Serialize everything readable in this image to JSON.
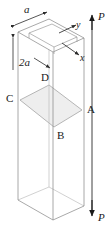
{
  "figure": {
    "type": "engineering-mechanics-diagram",
    "colors": {
      "outline": "#8c8c8c",
      "hidden_outline": "#b5b5b5",
      "section_fill": "#eeeeee",
      "section_edge": "#9a9a9a",
      "arrow": "#1a1a1a",
      "text": "#1a1a1a",
      "background": "#ffffff"
    }
  },
  "dimensions": {
    "width_label": "a",
    "depth_label": "2a"
  },
  "axes": {
    "x_label": "x",
    "y_label": "y"
  },
  "loads": {
    "top_label": "P",
    "bottom_label": "P"
  },
  "section": {
    "name": "ABCD",
    "vertices": [
      {
        "id": "A",
        "label": "A",
        "position": "right"
      },
      {
        "id": "B",
        "label": "B",
        "position": "bottom"
      },
      {
        "id": "C",
        "label": "C",
        "position": "left"
      },
      {
        "id": "D",
        "label": "D",
        "position": "top"
      }
    ]
  }
}
